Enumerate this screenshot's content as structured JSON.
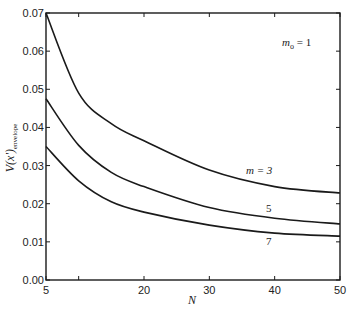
{
  "chart_data": {
    "type": "line",
    "title": "",
    "xlabel": "N",
    "ylabel": "V(x')|envelope",
    "ylabel_main": "V(x')",
    "ylabel_sub": "envelope",
    "xlim": [
      5,
      50
    ],
    "ylim": [
      0.0,
      0.07
    ],
    "grid": false,
    "legend": "none (inline curve labels)",
    "x_ticks": [
      5,
      10,
      20,
      30,
      40,
      50
    ],
    "x_tick_labels": [
      "5",
      "",
      "20",
      "30",
      "40",
      "50"
    ],
    "y_ticks": [
      0.0,
      0.01,
      0.02,
      0.03,
      0.04,
      0.05,
      0.06,
      0.07
    ],
    "y_tick_labels": [
      "0.00",
      "0.01",
      "0.02",
      "0.03",
      "0.04",
      "0.05",
      "0.06",
      "0.07"
    ],
    "x": [
      5,
      10,
      15,
      20,
      30,
      40,
      50
    ],
    "series": [
      {
        "name": "m = 3",
        "values": [
          0.07,
          0.049,
          0.041,
          0.0365,
          0.0288,
          0.0245,
          0.0228
        ]
      },
      {
        "name": "m = 5",
        "values": [
          0.0475,
          0.0353,
          0.0282,
          0.0245,
          0.019,
          0.0162,
          0.0147
        ]
      },
      {
        "name": "m = 7",
        "values": [
          0.035,
          0.026,
          0.0205,
          0.0178,
          0.0144,
          0.0123,
          0.0115
        ]
      }
    ],
    "annotations": [
      {
        "text": "m₀ = 1",
        "x": 45,
        "y": 0.0625
      },
      {
        "text": "m = 3",
        "x": 36,
        "y": 0.0275
      },
      {
        "text": "5",
        "x": 38,
        "y": 0.0178
      },
      {
        "text": "7",
        "x": 38,
        "y": 0.0098
      }
    ]
  },
  "labels": {
    "annot_m0": "m",
    "annot_m0_sub": "o",
    "annot_m0_eq": " = 1",
    "annot_m3": "m = 3",
    "annot_m5": "5",
    "annot_m7": "7",
    "xlabel": "N",
    "ylabel_main": "V(x')",
    "ylabel_sub": "envelope"
  },
  "style": {
    "line_color": "#1a1a1a",
    "axis_color": "#1a1a1a"
  }
}
